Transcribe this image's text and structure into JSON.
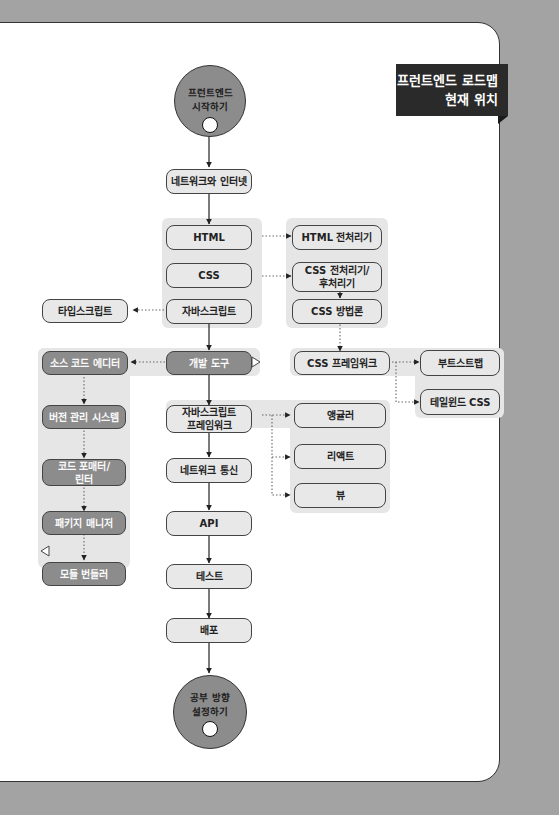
{
  "badge": {
    "line1": "프런트엔드 로드맵",
    "line2": "현재 위치"
  },
  "start": {
    "line1": "프런트엔드",
    "line2": "시작하기"
  },
  "end": {
    "line1": "공부 방향",
    "line2": "설정하기"
  },
  "main_path": [
    {
      "id": "network",
      "label": "네트워크와 인터넷"
    },
    {
      "id": "html",
      "label": "HTML"
    },
    {
      "id": "css",
      "label": "CSS"
    },
    {
      "id": "js",
      "label": "자바스크립트"
    },
    {
      "id": "devtools",
      "label": "개발 도구",
      "current": true
    },
    {
      "id": "jsfw",
      "label": "자바스크립트\n프레임워크"
    },
    {
      "id": "netcomm",
      "label": "네트워크 통신"
    },
    {
      "id": "api",
      "label": "API"
    },
    {
      "id": "test",
      "label": "테스트"
    },
    {
      "id": "deploy",
      "label": "배포"
    }
  ],
  "css_branch": [
    {
      "id": "htmlpre",
      "label": "HTML 전처리기"
    },
    {
      "id": "csspre",
      "label": "CSS 전처리기/\n후처리기"
    },
    {
      "id": "cssmethod",
      "label": "CSS 방법론"
    },
    {
      "id": "cssfw",
      "label": "CSS 프레임워크"
    },
    {
      "id": "bootstrap",
      "label": "부트스트랩"
    },
    {
      "id": "tailwind",
      "label": "테일윈드 CSS"
    }
  ],
  "ts": {
    "label": "타입스크립트"
  },
  "tools_branch": [
    {
      "id": "editor",
      "label": "소스 코드 에디터"
    },
    {
      "id": "vcs",
      "label": "버전 관리 시스템"
    },
    {
      "id": "formatter",
      "label": "코드 포매터/\n린터"
    },
    {
      "id": "pkg",
      "label": "패키지 매니저"
    },
    {
      "id": "bundler",
      "label": "모듈 번들러",
      "marker": true
    }
  ],
  "js_frameworks": [
    {
      "id": "angular",
      "label": "앵귤러"
    },
    {
      "id": "react",
      "label": "리액트"
    },
    {
      "id": "vue",
      "label": "뷰"
    }
  ],
  "colors": {
    "background": "#a3a3a3",
    "card": "#ffffff",
    "box": "#e8e8e8",
    "highlight": "#8c8c8c",
    "badge": "#2a2a2a"
  }
}
